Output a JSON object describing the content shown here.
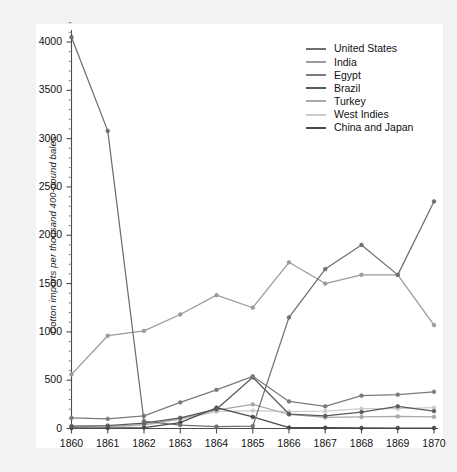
{
  "chart_data": {
    "type": "line",
    "title": "",
    "xlabel": "",
    "ylabel": "Cotton imports per thousand 400-pound bales",
    "x": [
      1860,
      1861,
      1862,
      1863,
      1864,
      1865,
      1866,
      1867,
      1868,
      1869,
      1870
    ],
    "categories": [
      "1860",
      "1861",
      "1862",
      "1863",
      "1864",
      "1865",
      "1866",
      "1867",
      "1868",
      "1869",
      "1870"
    ],
    "xlim": [
      1860,
      1870
    ],
    "ylim": [
      0,
      4200
    ],
    "yticks": [
      0,
      500,
      1000,
      1500,
      2000,
      2500,
      3000,
      3500,
      4000
    ],
    "ytick_labels": [
      "0",
      "500",
      "1000",
      "1500",
      "2000",
      "2500",
      "3000",
      "3500",
      "4000"
    ],
    "grid": false,
    "legend_position": "upper right",
    "markers": "circle",
    "series": [
      {
        "name": "United States",
        "color": "#6e6e6e",
        "values": [
          4050,
          3080,
          75,
          35,
          20,
          25,
          1150,
          1650,
          1900,
          1590,
          2350
        ]
      },
      {
        "name": "India",
        "color": "#9a9a9a",
        "values": [
          560,
          960,
          1010,
          1180,
          1380,
          1250,
          1720,
          1500,
          1590,
          1590,
          1070
        ]
      },
      {
        "name": "Egypt",
        "color": "#7a7a7a",
        "values": [
          110,
          100,
          130,
          270,
          400,
          540,
          280,
          230,
          340,
          350,
          380
        ]
      },
      {
        "name": "Brazil",
        "color": "#5a5a5a",
        "values": [
          25,
          30,
          55,
          110,
          200,
          530,
          150,
          130,
          170,
          230,
          180
        ]
      },
      {
        "name": "Turkey",
        "color": "#a8a8a8",
        "values": [
          15,
          20,
          40,
          100,
          190,
          250,
          145,
          115,
          120,
          125,
          120
        ]
      },
      {
        "name": "West Indies",
        "color": "#cccccc",
        "values": [
          10,
          15,
          35,
          95,
          175,
          185,
          175,
          180,
          205,
          205,
          215
        ]
      },
      {
        "name": "China and Japan",
        "color": "#4a4a4a",
        "values": [
          5,
          5,
          10,
          60,
          215,
          120,
          10,
          8,
          6,
          5,
          5
        ]
      }
    ]
  },
  "legend": {
    "entries": [
      {
        "label": "United States"
      },
      {
        "label": "India"
      },
      {
        "label": "Egypt"
      },
      {
        "label": "Brazil"
      },
      {
        "label": "Turkey"
      },
      {
        "label": "West Indies"
      },
      {
        "label": "China and Japan"
      }
    ]
  },
  "axes": {
    "y_axis_title": "Cotton imports per thousand 400-pound bales"
  }
}
